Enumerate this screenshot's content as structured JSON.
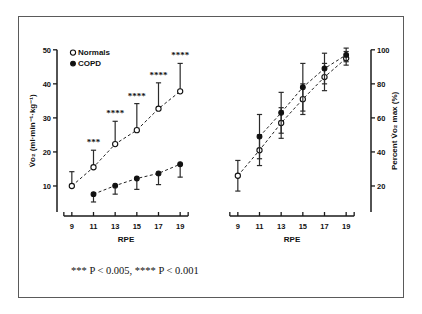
{
  "figure": {
    "caption": "*** P < 0.005, **** P < 0.001",
    "legend": [
      {
        "label": "Normals",
        "marker": "open-circle"
      },
      {
        "label": "COPD",
        "marker": "filled-circle"
      }
    ]
  },
  "chart_data": [
    {
      "type": "line",
      "panel": "left",
      "title": "",
      "xlabel": "RPE",
      "ylabel": "V̇o₂ (ml·min⁻¹·kg⁻¹)",
      "x": [
        9,
        11,
        13,
        15,
        17,
        19
      ],
      "xticklabels": [
        "9",
        "11",
        "13",
        "15",
        "17",
        "19"
      ],
      "xlim": [
        8,
        20
      ],
      "ylim": [
        5,
        52
      ],
      "yticks": [
        10,
        20,
        30,
        40,
        50
      ],
      "yticklabels": [
        "10",
        "20",
        "30",
        "40",
        "50"
      ],
      "grid": false,
      "legend_position": "upper-left",
      "series": [
        {
          "name": "Normals",
          "marker": "open-circle",
          "values": [
            10.0,
            15.5,
            22.3,
            26.4,
            32.7,
            37.8
          ],
          "err_upper": [
            14.2,
            20.5,
            29.0,
            34.2,
            40.3,
            46.0
          ],
          "err_lower": [
            10.0,
            15.5,
            22.3,
            26.4,
            32.7,
            37.8
          ],
          "significance": [
            "",
            "***",
            "****",
            "****",
            "****",
            "****"
          ]
        },
        {
          "name": "COPD",
          "marker": "filled-circle",
          "values": [
            null,
            7.6,
            10.1,
            12.2,
            13.7,
            16.4
          ],
          "err_upper": [
            null,
            7.6,
            10.1,
            12.2,
            13.7,
            16.4
          ],
          "err_lower": [
            null,
            5.3,
            7.6,
            9.0,
            10.4,
            12.6
          ],
          "significance": [
            "",
            "",
            "",
            "",
            "",
            ""
          ]
        }
      ]
    },
    {
      "type": "line",
      "panel": "right",
      "title": "",
      "xlabel": "RPE",
      "ylabel": "Percent V̇o₂ max (%)",
      "x": [
        9,
        11,
        13,
        15,
        17,
        19
      ],
      "xticklabels": [
        "9",
        "11",
        "13",
        "15",
        "17",
        "19"
      ],
      "xlim": [
        8,
        20
      ],
      "ylim": [
        10,
        104
      ],
      "yticks": [
        20,
        40,
        60,
        80,
        100
      ],
      "yticklabels": [
        "20",
        "40",
        "60",
        "80",
        "100"
      ],
      "grid": false,
      "legend_position": "none",
      "series": [
        {
          "name": "Normals",
          "marker": "open-circle",
          "values": [
            26.0,
            41.0,
            57.0,
            71.0,
            84.0,
            95.0
          ],
          "err_upper": [
            35.0,
            50.0,
            66.0,
            80.0,
            92.0,
            99.0
          ],
          "err_lower": [
            17.0,
            32.0,
            48.0,
            62.0,
            76.0,
            91.0
          ],
          "significance": [
            "",
            "",
            "",
            "",
            "",
            ""
          ]
        },
        {
          "name": "COPD",
          "marker": "filled-circle",
          "values": [
            null,
            49.0,
            63.0,
            78.0,
            89.0,
            97.0
          ],
          "err_upper": [
            null,
            62.0,
            75.0,
            92.0,
            98.0,
            101.0
          ],
          "err_lower": [
            null,
            36.0,
            51.0,
            64.0,
            80.0,
            93.0
          ],
          "significance": [
            "",
            "",
            "",
            "",
            "",
            ""
          ]
        }
      ]
    }
  ]
}
